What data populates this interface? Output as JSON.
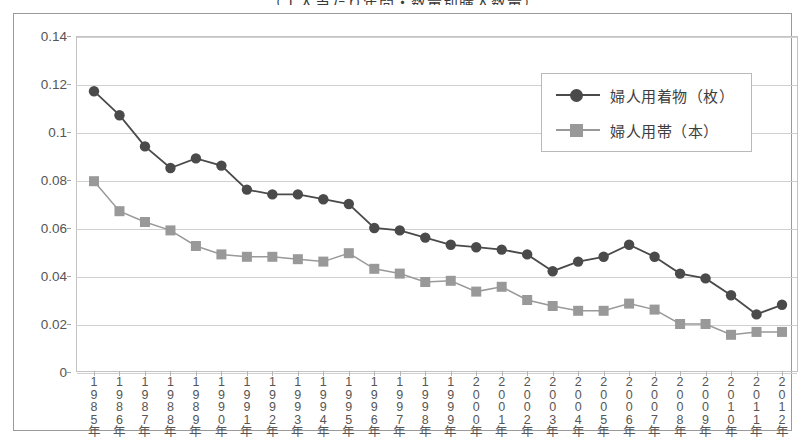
{
  "chart_title_fragment": "（１人当たり年間・数量別購入数量）",
  "colors": {
    "series1": "#4a4a4a",
    "series2": "#999999",
    "grid": "#d0d0d0",
    "axis": "#9e9e9e",
    "frame": "#9a9a9a",
    "text": "#555555"
  },
  "legend": {
    "position": "top-right",
    "items": [
      {
        "label": "婦人用着物（枚）",
        "marker": "circle-marker-icon",
        "color": "#4a4a4a"
      },
      {
        "label": "婦人用帯（本）",
        "marker": "square-marker-icon",
        "color": "#999999"
      }
    ]
  },
  "y_axis": {
    "ticks": [
      "0",
      "0.02",
      "0.04",
      "0.06",
      "0.08",
      "0.1",
      "0.12",
      "0.14"
    ],
    "values": [
      0,
      0.02,
      0.04,
      0.06,
      0.08,
      0.1,
      0.12,
      0.14
    ],
    "min": 0,
    "max": 0.14
  },
  "chart_data": {
    "type": "line",
    "title": "（１人当たり年間・数量別購入数量）",
    "xlabel": "",
    "ylabel": "",
    "ylim": [
      0,
      0.14
    ],
    "ytick_step": 0.02,
    "grid": true,
    "legend_position": "top-right",
    "categories": [
      "1985年",
      "1986年",
      "1987年",
      "1988年",
      "1989年",
      "1990年",
      "1991年",
      "1992年",
      "1993年",
      "1994年",
      "1995年",
      "1996年",
      "1997年",
      "1998年",
      "1999年",
      "2000年",
      "2001年",
      "2002年",
      "2003年",
      "2004年",
      "2005年",
      "2006年",
      "2007年",
      "2008年",
      "2009年",
      "2010年",
      "2011年",
      "2012年"
    ],
    "series": [
      {
        "name": "婦人用着物（枚）",
        "marker": "circle",
        "color": "#4a4a4a",
        "values": [
          0.117,
          0.107,
          0.094,
          0.085,
          0.089,
          0.086,
          0.076,
          0.074,
          0.074,
          0.072,
          0.07,
          0.06,
          0.059,
          0.056,
          0.053,
          0.052,
          0.051,
          0.049,
          0.042,
          0.046,
          0.048,
          0.053,
          0.048,
          0.041,
          0.039,
          0.032,
          0.032,
          0.024
        ]
      },
      {
        "name": "婦人用帯（本）",
        "marker": "square",
        "color": "#999999",
        "values": [
          0.0795,
          0.067,
          0.0625,
          0.059,
          0.0525,
          0.049,
          0.048,
          0.048,
          0.047,
          0.046,
          0.0495,
          0.043,
          0.041,
          0.0375,
          0.038,
          0.0335,
          0.0355,
          0.03,
          0.0275,
          0.0255,
          0.0255,
          0.0285,
          0.026,
          0.02,
          0.02,
          0.0155,
          0.0167,
          0.0167
        ]
      }
    ],
    "final_circle_value": 0.028
  }
}
